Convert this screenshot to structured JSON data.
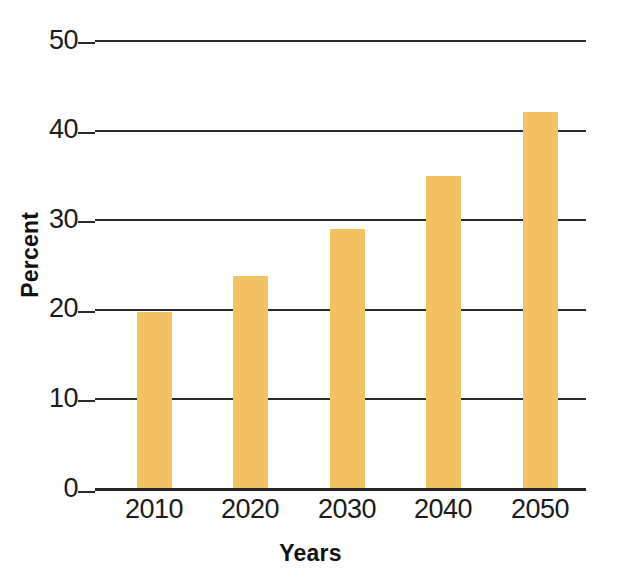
{
  "chart_data": {
    "type": "bar",
    "title": "",
    "subtitle": "",
    "xlabel": "Years",
    "ylabel": "Percent",
    "categories": [
      "2010",
      "2020",
      "2030",
      "2040",
      "2050"
    ],
    "values": [
      19.6,
      23.7,
      28.9,
      34.8,
      42.0
    ],
    "series": [
      {
        "name": "Percent",
        "values": [
          19.6,
          23.7,
          28.9,
          34.8,
          42.0
        ]
      }
    ],
    "ylim": [
      0,
      50
    ],
    "yticks": [
      0,
      10,
      20,
      30,
      40,
      50
    ],
    "ytick_labels": [
      "0",
      "10",
      "20",
      "30",
      "40",
      "50"
    ],
    "xtick_labels": [
      "2010",
      "2020",
      "2030",
      "2040",
      "2050"
    ],
    "grid": true,
    "grid_axis": "y",
    "legend": false,
    "legend_position": "none",
    "annotations": [],
    "colors": {
      "bar": "#f5c263",
      "grid": "#2b2b2b",
      "axis": "#232323",
      "text": "#1b1b1b",
      "background": "#ffffff"
    }
  },
  "axes": {
    "y_ticks": [
      {
        "label": "50",
        "value": 50
      },
      {
        "label": "40",
        "value": 40
      },
      {
        "label": "30",
        "value": 30
      },
      {
        "label": "20",
        "value": 20
      },
      {
        "label": "10",
        "value": 10
      },
      {
        "label": "0",
        "value": 0
      }
    ],
    "x_ticks": [
      {
        "label": "2010"
      },
      {
        "label": "2020"
      },
      {
        "label": "2030"
      },
      {
        "label": "2040"
      },
      {
        "label": "2050"
      }
    ],
    "x_title": "Years",
    "y_title": "Percent"
  },
  "bars": [
    {
      "category": "2010",
      "value": 19.6
    },
    {
      "category": "2020",
      "value": 23.7
    },
    {
      "category": "2030",
      "value": 28.9
    },
    {
      "category": "2040",
      "value": 34.8
    },
    {
      "category": "2050",
      "value": 42.0
    }
  ]
}
